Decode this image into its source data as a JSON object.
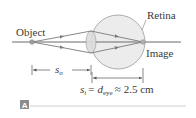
{
  "figure": {
    "panel_label": "A",
    "labels": {
      "object": "Object",
      "retina": "Retina",
      "image": "Image"
    },
    "dimensions": {
      "object_distance": {
        "symbol": "s",
        "subscript": "o"
      },
      "image_distance": {
        "symbol": "s",
        "subscript": "i",
        "equals": "=",
        "d_symbol": "d",
        "d_subscript": "eye",
        "approx": "≈",
        "value": "2.5 cm"
      }
    },
    "colors": {
      "axis_line": "#6b6b6b",
      "rays": "#7a7a7a",
      "eye_fill": "#ececec",
      "eye_stroke": "#9a9a9a",
      "lens_fill": "#dcdcdc",
      "badge_fill": "#8c8c8c",
      "rule": "#cfcfcf",
      "text": "#3a3a3a"
    }
  }
}
